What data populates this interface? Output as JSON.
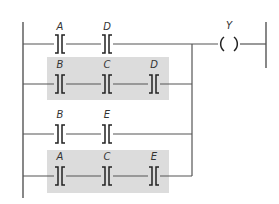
{
  "diagram": {
    "type": "ladder-logic",
    "output_coil": {
      "label": "Y"
    },
    "branches": [
      {
        "id": 1,
        "shaded": false,
        "contacts": [
          "A",
          "D"
        ]
      },
      {
        "id": 2,
        "shaded": true,
        "contacts": [
          "B",
          "C",
          "D"
        ]
      },
      {
        "id": 3,
        "shaded": false,
        "contacts": [
          "B",
          "E"
        ]
      },
      {
        "id": 4,
        "shaded": true,
        "contacts": [
          "A",
          "C",
          "E"
        ]
      }
    ],
    "colors": {
      "shade": "#dcdcdc",
      "wire": "#555555",
      "symbol": "#222222"
    }
  }
}
